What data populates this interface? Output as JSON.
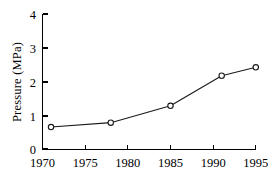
{
  "chart_data": {
    "type": "line",
    "title": "",
    "subtitle": "",
    "xlabel": "",
    "ylabel": "Pressure (MPa)",
    "xlim": [
      1970,
      1996
    ],
    "ylim": [
      0,
      4
    ],
    "x_ticks": [
      1970,
      1975,
      1980,
      1985,
      1990,
      1995
    ],
    "x_tick_labels": [
      "1970",
      "1975",
      "1980",
      "1985",
      "1990",
      "1995"
    ],
    "y_ticks": [
      0,
      1,
      2,
      3,
      4
    ],
    "y_tick_labels": [
      "0",
      "1",
      "2",
      "3",
      "4"
    ],
    "grid": false,
    "legend": null,
    "marker": "open-circle",
    "series": [
      {
        "name": "Pressure",
        "x": [
          1971,
          1978,
          1985,
          1991,
          1995
        ],
        "values": [
          0.65,
          0.78,
          1.28,
          2.17,
          2.42
        ]
      }
    ],
    "annotations": []
  },
  "figure": {
    "background_color": "#ffffff",
    "line_color": "#1a1a1a",
    "axis_color": "#000000",
    "marker_fill": "#ffffff"
  }
}
